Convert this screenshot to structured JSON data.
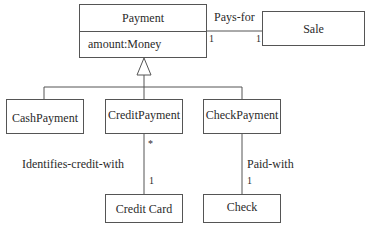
{
  "diagram": {
    "type": "UML class diagram",
    "classes": {
      "payment": {
        "name": "Payment",
        "attributes": [
          "amount:Money"
        ]
      },
      "sale": {
        "name": "Sale"
      },
      "cash_payment": {
        "name": "CashPayment"
      },
      "credit_payment": {
        "name": "CreditPayment"
      },
      "check_payment": {
        "name": "CheckPayment"
      },
      "credit_card": {
        "name": "Credit Card"
      },
      "check": {
        "name": "Check"
      }
    },
    "associations": {
      "pays_for": {
        "label": "Pays-for",
        "from": "Payment",
        "to": "Sale",
        "from_mult": "1",
        "to_mult": "1"
      },
      "identifies_credit_with": {
        "label": "Identifies-credit-with",
        "from": "CreditPayment",
        "to": "Credit Card",
        "from_mult": "*",
        "to_mult": "1"
      },
      "paid_with": {
        "label": "Paid-with",
        "from": "CheckPayment",
        "to": "Check",
        "to_mult": "1"
      }
    },
    "generalization": {
      "parent": "Payment",
      "children": [
        "CashPayment",
        "CreditPayment",
        "CheckPayment"
      ]
    }
  }
}
